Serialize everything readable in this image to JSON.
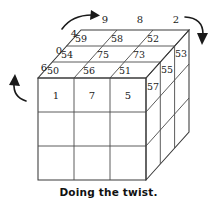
{
  "figure": {
    "caption": "Doing the twist.",
    "type": "3d-cube-diagram",
    "dimensions": "3x3x3",
    "line_color": "#4a4a4a",
    "text_color": "#1a1a1a",
    "background": "#ffffff"
  },
  "top_face": {
    "description": "Top face of cube, 3x3 grid of numbered cells",
    "rows": [
      [
        "59",
        "58",
        "52"
      ],
      [
        "54",
        "75",
        "73"
      ],
      [
        "50",
        "56",
        "51"
      ]
    ]
  },
  "front_face": {
    "description": "Front face of cube, 3x3 grid, only top row labeled",
    "rows": [
      [
        "1",
        "7",
        "5"
      ],
      [
        "",
        "",
        ""
      ],
      [
        "",
        "",
        ""
      ]
    ]
  },
  "right_face": {
    "description": "Right side face of cube, numbers on upper cells",
    "labels": [
      "53",
      "55",
      "57"
    ]
  },
  "edge_labels": {
    "top_row": [
      "9",
      "8",
      "2"
    ],
    "left_column": [
      "4",
      "0",
      "6"
    ]
  },
  "arrows": [
    {
      "name": "top-left-arrow",
      "direction": "right",
      "style": "curved"
    },
    {
      "name": "right-arrow",
      "direction": "down",
      "style": "curved"
    },
    {
      "name": "left-arrow",
      "direction": "up",
      "style": "curved"
    }
  ]
}
